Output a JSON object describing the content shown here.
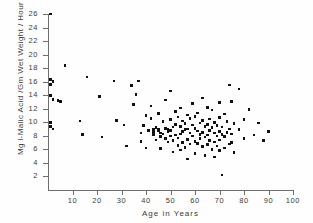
{
  "chart_data": {
    "type": "scatter",
    "title": "",
    "xlabel": "Age in Years",
    "ylabel": "Mg l-Malic Acid /Gm Wet Weight / Hour",
    "xlim": [
      0,
      100
    ],
    "ylim": [
      0,
      26
    ],
    "xticks": [
      10,
      20,
      30,
      40,
      50,
      60,
      70,
      80,
      90,
      100
    ],
    "yticks": [
      2,
      4,
      6,
      8,
      10,
      12,
      14,
      16,
      18,
      20,
      22,
      24,
      26
    ],
    "grid": false,
    "legend": null,
    "marker": "filled-square",
    "marker_color": "#111111",
    "points": [
      [
        1,
        26.0
      ],
      [
        1,
        16.3
      ],
      [
        1,
        15.6
      ],
      [
        1,
        14.0
      ],
      [
        1,
        10.0
      ],
      [
        1,
        9.4
      ],
      [
        2,
        16.0
      ],
      [
        2,
        13.4
      ],
      [
        2,
        9.0
      ],
      [
        4,
        13.2
      ],
      [
        5,
        13.1
      ],
      [
        7,
        18.4
      ],
      [
        13,
        10.2
      ],
      [
        14,
        8.2
      ],
      [
        16,
        16.7
      ],
      [
        21,
        13.8
      ],
      [
        22,
        7.8
      ],
      [
        27,
        16.1
      ],
      [
        28,
        10.3
      ],
      [
        31,
        9.6
      ],
      [
        32,
        6.5
      ],
      [
        34,
        15.4
      ],
      [
        35,
        12.6
      ],
      [
        36,
        14.1
      ],
      [
        37,
        16.1
      ],
      [
        38,
        8.4
      ],
      [
        38,
        7.2
      ],
      [
        39,
        9.5
      ],
      [
        40,
        11.0
      ],
      [
        40,
        6.2
      ],
      [
        41,
        8.8
      ],
      [
        42,
        12.4
      ],
      [
        42,
        10.6
      ],
      [
        43,
        8.9
      ],
      [
        43,
        8.5
      ],
      [
        43,
        8.2
      ],
      [
        44,
        9.2
      ],
      [
        44,
        7.4
      ],
      [
        45,
        11.3
      ],
      [
        45,
        9.0
      ],
      [
        45,
        8.7
      ],
      [
        46,
        8.4
      ],
      [
        46,
        7.9
      ],
      [
        46,
        6.1
      ],
      [
        47,
        10.1
      ],
      [
        47,
        8.3
      ],
      [
        48,
        13.3
      ],
      [
        48,
        9.1
      ],
      [
        48,
        7.6
      ],
      [
        49,
        8.9
      ],
      [
        49,
        8.6
      ],
      [
        49,
        7.1
      ],
      [
        50,
        14.6
      ],
      [
        50,
        10.4
      ],
      [
        50,
        8.8
      ],
      [
        50,
        8.0
      ],
      [
        51,
        9.3
      ],
      [
        51,
        7.3
      ],
      [
        51,
        5.6
      ],
      [
        52,
        11.6
      ],
      [
        52,
        9.7
      ],
      [
        52,
        8.1
      ],
      [
        53,
        10.8
      ],
      [
        53,
        7.7
      ],
      [
        53,
        6.6
      ],
      [
        54,
        12.1
      ],
      [
        54,
        9.4
      ],
      [
        54,
        8.3
      ],
      [
        54,
        5.9
      ],
      [
        55,
        10.2
      ],
      [
        55,
        8.6
      ],
      [
        55,
        7.0
      ],
      [
        56,
        9.8
      ],
      [
        56,
        8.9
      ],
      [
        56,
        6.3
      ],
      [
        57,
        11.1
      ],
      [
        57,
        9.0
      ],
      [
        57,
        7.5
      ],
      [
        57,
        4.6
      ],
      [
        58,
        10.6
      ],
      [
        58,
        8.4
      ],
      [
        58,
        6.8
      ],
      [
        59,
        12.8
      ],
      [
        59,
        9.6
      ],
      [
        59,
        8.0
      ],
      [
        60,
        10.9
      ],
      [
        60,
        9.1
      ],
      [
        60,
        7.2
      ],
      [
        60,
        5.4
      ],
      [
        61,
        11.4
      ],
      [
        61,
        8.7
      ],
      [
        61,
        6.9
      ],
      [
        62,
        9.9
      ],
      [
        62,
        8.2
      ],
      [
        62,
        7.6
      ],
      [
        63,
        13.6
      ],
      [
        63,
        10.3
      ],
      [
        63,
        8.5
      ],
      [
        63,
        6.4
      ],
      [
        64,
        9.4
      ],
      [
        64,
        7.8
      ],
      [
        64,
        5.1
      ],
      [
        65,
        12.2
      ],
      [
        65,
        9.7
      ],
      [
        65,
        8.1
      ],
      [
        65,
        6.7
      ],
      [
        66,
        10.5
      ],
      [
        66,
        8.8
      ],
      [
        66,
        7.3
      ],
      [
        67,
        11.8
      ],
      [
        67,
        9.2
      ],
      [
        67,
        6.0
      ],
      [
        68,
        10.0
      ],
      [
        68,
        8.4
      ],
      [
        68,
        7.1
      ],
      [
        68,
        4.9
      ],
      [
        69,
        9.5
      ],
      [
        69,
        8.0
      ],
      [
        69,
        6.5
      ],
      [
        70,
        12.9
      ],
      [
        70,
        10.7
      ],
      [
        70,
        8.6
      ],
      [
        70,
        7.4
      ],
      [
        70,
        5.8
      ],
      [
        71,
        9.3
      ],
      [
        71,
        8.2
      ],
      [
        71,
        2.2
      ],
      [
        72,
        11.2
      ],
      [
        72,
        7.9
      ],
      [
        72,
        6.2
      ],
      [
        73,
        10.1
      ],
      [
        73,
        8.5
      ],
      [
        74,
        15.5
      ],
      [
        74,
        9.0
      ],
      [
        74,
        6.8
      ],
      [
        75,
        13.1
      ],
      [
        75,
        8.3
      ],
      [
        75,
        7.0
      ],
      [
        76,
        9.8
      ],
      [
        76,
        5.5
      ],
      [
        78,
        14.9
      ],
      [
        78,
        8.9
      ],
      [
        80,
        10.4
      ],
      [
        80,
        7.6
      ],
      [
        82,
        11.9
      ],
      [
        84,
        8.1
      ],
      [
        86,
        9.9
      ],
      [
        88,
        7.3
      ],
      [
        90,
        8.6
      ]
    ]
  }
}
